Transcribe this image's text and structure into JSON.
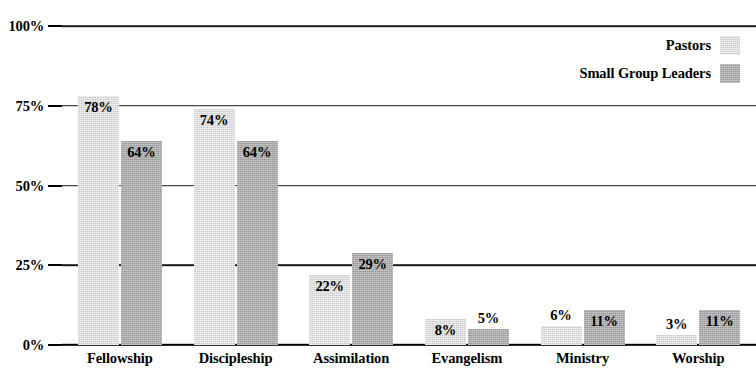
{
  "chart_data": {
    "type": "bar",
    "title": "",
    "subtitle": "",
    "xlabel": "",
    "ylabel": "",
    "categories": [
      "Fellowship",
      "Discipleship",
      "Assimilation",
      "Evangelism",
      "Ministry",
      "Worship"
    ],
    "series": [
      {
        "name": "Pastors",
        "color": "#cbcbcb",
        "values": [
          78,
          74,
          22,
          8,
          6,
          3
        ],
        "value_labels": [
          "78%",
          "74%",
          "22%",
          "8%",
          "6%",
          "3%"
        ],
        "label_placement": [
          "inside",
          "inside",
          "inside",
          "inside",
          "outside",
          "outside"
        ]
      },
      {
        "name": "Small Group Leaders",
        "color": "#9a9a9a",
        "values": [
          64,
          64,
          29,
          5,
          11,
          11
        ],
        "value_labels": [
          "64%",
          "64%",
          "29%",
          "5%",
          "11%",
          "11%"
        ],
        "label_placement": [
          "inside",
          "inside",
          "inside",
          "outside",
          "inside",
          "inside"
        ]
      }
    ],
    "yticks": [
      0,
      25,
      50,
      75,
      100
    ],
    "ytick_labels": [
      "0%",
      "25%",
      "50%",
      "75%",
      "100%"
    ],
    "ylim": [
      0,
      100
    ],
    "grid": true,
    "legend_position": "top-right",
    "value_format": "percent"
  },
  "legend": {
    "items": [
      {
        "label": "Pastors",
        "color": "#cbcbcb"
      },
      {
        "label": "Small Group Leaders",
        "color": "#9a9a9a"
      }
    ]
  },
  "colors": {
    "series_light": "#cbcbcb",
    "series_dark": "#9a9a9a",
    "axis": "#000000",
    "grid": "#1a1a1a",
    "background": "#ffffff",
    "text": "#000000"
  }
}
